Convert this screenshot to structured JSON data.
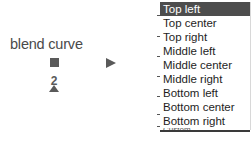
{
  "node": {
    "label": "blend curve",
    "icons": [
      "square-port-icon",
      "number-shape-icon",
      "arrow-right-icon"
    ],
    "shape_glyph": "2"
  },
  "dropdown": {
    "selected_index": 0,
    "items": [
      {
        "label": "Top left"
      },
      {
        "label": "Top center"
      },
      {
        "label": "Top right"
      },
      {
        "label": "Middle left"
      },
      {
        "label": "Middle center"
      },
      {
        "label": "Middle right"
      },
      {
        "label": "Bottom left"
      },
      {
        "label": "Bottom center"
      },
      {
        "label": "Bottom right"
      },
      {
        "label": "Custom"
      }
    ],
    "colors": {
      "selected_bg": "#4d4d4d",
      "selected_text": "#ffffff",
      "text": "#1e1e1e"
    }
  }
}
